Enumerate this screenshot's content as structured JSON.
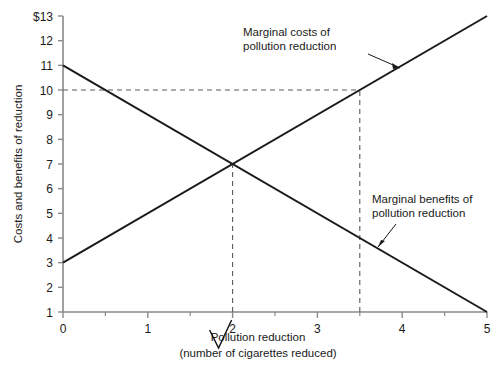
{
  "chart_data": {
    "type": "line",
    "title": "",
    "xlabel": "Pollution reduction",
    "xlabel_sub": "(number of cigarettes reduced)",
    "ylabel": "Costs and benefits of reduction",
    "xlim": [
      0,
      5
    ],
    "ylim": [
      1,
      13
    ],
    "grid": false,
    "legend_position": "inline-annotation",
    "x_ticks": [
      "0",
      "1",
      "2",
      "3",
      "4",
      "5"
    ],
    "x_tick_values": [
      0,
      1,
      2,
      3,
      4,
      5
    ],
    "x_minor_ticks": [
      0.5,
      1.5,
      2.5,
      3.5,
      4.5
    ],
    "y_ticks": [
      "1",
      "2",
      "3",
      "4",
      "5",
      "6",
      "7",
      "8",
      "9",
      "10",
      "11",
      "12",
      "$13"
    ],
    "y_tick_values": [
      1,
      2,
      3,
      4,
      5,
      6,
      7,
      8,
      9,
      10,
      11,
      12,
      13
    ],
    "series": [
      {
        "name": "Marginal costs of pollution reduction",
        "x": [
          0,
          5
        ],
        "values": [
          3,
          13
        ],
        "color": "#1a1a1a"
      },
      {
        "name": "Marginal benefits of pollution reduction",
        "x": [
          0,
          5
        ],
        "values": [
          11,
          1
        ],
        "color": "#1a1a1a"
      }
    ],
    "annotations": [
      {
        "id": "marginal-costs",
        "line1": "Marginal costs of",
        "line2": "pollution reduction",
        "points_to_x": 3.75,
        "points_to_y": 10.5
      },
      {
        "id": "marginal-benefits",
        "line1": "Marginal benefits of",
        "line2": "pollution reduction",
        "points_to_x": 3.95,
        "points_to_y": 3.1
      }
    ],
    "guides": [
      {
        "id": "equilibrium-vertical",
        "type": "vertical",
        "x": 2,
        "from_y": 1,
        "to_y": 7,
        "style": "dashed"
      },
      {
        "id": "cost-level-horizontal",
        "type": "horizontal",
        "y": 10,
        "from_x": 0,
        "to_x": 3.5,
        "style": "dashed"
      },
      {
        "id": "cost-level-vertical",
        "type": "vertical",
        "x": 3.5,
        "from_y": 1,
        "to_y": 10,
        "style": "dashed"
      }
    ],
    "markers": [
      {
        "id": "optimum-checkmark",
        "at_x": 2,
        "label": "checkmark"
      }
    ],
    "colors": {
      "axis": "#8a8a8a",
      "line": "#1a1a1a",
      "guide": "#5a5a5a",
      "text": "#1a1a1a",
      "background": "#ffffff"
    }
  }
}
